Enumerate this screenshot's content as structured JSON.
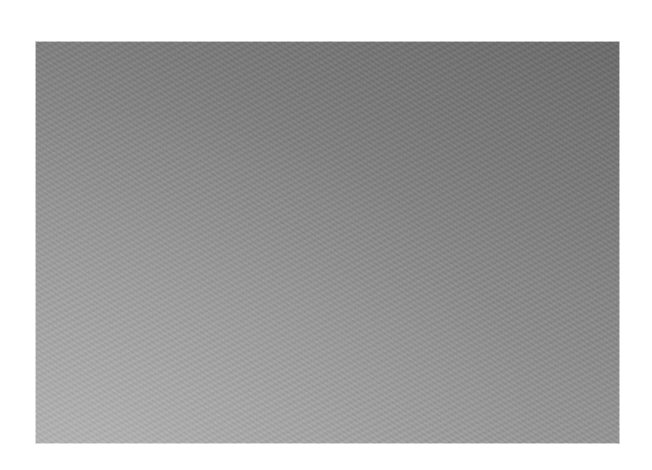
{
  "image": {
    "description": "Textured gray gradient surface on white background",
    "colors": {
      "background": "#ffffff",
      "gradient_dark": "#6c6c6c",
      "gradient_light": "#ababab"
    }
  }
}
